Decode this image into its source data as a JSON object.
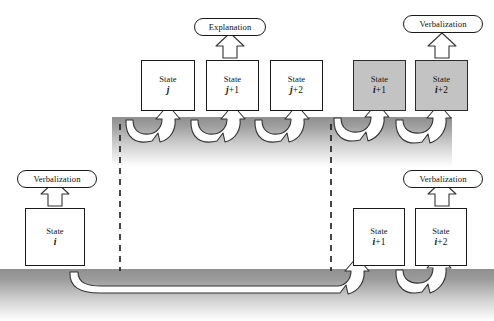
{
  "figure": {
    "background_color": "#ffffff",
    "shaded_box_color": "#c3c3c3",
    "band_color": "#9a9a9a",
    "outline_color": "#1a1a1a"
  },
  "labels": {
    "state_word": "State",
    "explanation": "Explanation",
    "verbalization": "Verbalization"
  },
  "pills": [
    {
      "id": "explanation-top",
      "text": "Explanation",
      "x": 194,
      "y": 18,
      "w": 72,
      "h": 18
    },
    {
      "id": "verbalization-top-right",
      "text": "Verbalization",
      "x": 403,
      "y": 15,
      "w": 80,
      "h": 18
    },
    {
      "id": "verbalization-left",
      "text": "Verbalization",
      "x": 17,
      "y": 170,
      "w": 80,
      "h": 18
    },
    {
      "id": "verbalization-bottom-right",
      "text": "Verbalization",
      "x": 403,
      "y": 170,
      "w": 80,
      "h": 18
    }
  ],
  "boxes": {
    "top_row": [
      {
        "id": "state-j",
        "word": "State",
        "index": "j",
        "plus": "",
        "x": 141,
        "y": 60,
        "w": 54,
        "h": 51,
        "shaded": false
      },
      {
        "id": "state-j1",
        "word": "State",
        "index": "j",
        "plus": "+1",
        "x": 206,
        "y": 60,
        "w": 53,
        "h": 51,
        "shaded": false
      },
      {
        "id": "state-j2",
        "word": "State",
        "index": "j",
        "plus": "+2",
        "x": 270,
        "y": 60,
        "w": 53,
        "h": 51,
        "shaded": false
      },
      {
        "id": "state-i1-top",
        "word": "State",
        "index": "i",
        "plus": "+1",
        "x": 353,
        "y": 60,
        "w": 53,
        "h": 51,
        "shaded": true
      },
      {
        "id": "state-i2-top",
        "word": "State",
        "index": "i",
        "plus": "+2",
        "x": 415,
        "y": 60,
        "w": 53,
        "h": 51,
        "shaded": true
      }
    ],
    "bottom_row": [
      {
        "id": "state-i",
        "word": "State",
        "index": "i",
        "plus": "",
        "x": 25,
        "y": 208,
        "w": 60,
        "h": 58,
        "shaded": false
      },
      {
        "id": "state-i1-bottom",
        "word": "State",
        "index": "i",
        "plus": "+1",
        "x": 353,
        "y": 208,
        "w": 52,
        "h": 58,
        "shaded": false
      },
      {
        "id": "state-i2-bottom",
        "word": "State",
        "index": "i",
        "plus": "+2",
        "x": 415,
        "y": 208,
        "w": 52,
        "h": 58,
        "shaded": false
      }
    ]
  },
  "bands": {
    "upper": {
      "x": 112,
      "y": 117,
      "w": 340,
      "h": 48
    },
    "lower": {
      "x": 0,
      "y": 269,
      "w": 494,
      "h": 52
    }
  },
  "dashed_lines": [
    {
      "id": "dashed-left",
      "x": 120,
      "y1": 124,
      "y2": 271
    },
    {
      "id": "dashed-right",
      "x": 331,
      "y1": 124,
      "y2": 271
    }
  ],
  "transitions": {
    "top_level": [
      {
        "from": "state-j",
        "to": "state-j1"
      },
      {
        "from": "state-j1",
        "to": "state-j2"
      },
      {
        "from": "state-j2",
        "to": "state-i1-top"
      },
      {
        "from": "state-i1-top",
        "to": "state-i2-top"
      }
    ],
    "bottom_level": [
      {
        "from": "state-i",
        "to": "state-i1-bottom"
      },
      {
        "from": "state-i1-bottom",
        "to": "state-i2-bottom"
      }
    ]
  },
  "output_arrows": [
    {
      "from": "state-j1",
      "to": "explanation-top"
    },
    {
      "from": "state-i2-top",
      "to": "verbalization-top-right"
    },
    {
      "from": "state-i",
      "to": "verbalization-left"
    },
    {
      "from": "state-i2-bottom",
      "to": "verbalization-bottom-right"
    }
  ]
}
